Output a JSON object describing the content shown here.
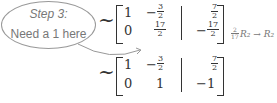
{
  "annotation": {
    "line1": "Step 3:",
    "line2": "Need a 1 here"
  },
  "tilde": "~",
  "matrix1": {
    "r1": {
      "c1": "1",
      "c2_sign": "−",
      "c2_num": "3",
      "c2_den": "2",
      "c3_num": "7",
      "c3_den": "2"
    },
    "r2": {
      "c1": "0",
      "c2_num": "17",
      "c2_den": "2",
      "c3_sign": "−",
      "c3_num": "17",
      "c3_den": "2"
    }
  },
  "operation": {
    "coef_num": "2",
    "coef_den": "17",
    "text": "R₂ → R₂"
  },
  "matrix2": {
    "r1": {
      "c1": "1",
      "c2_sign": "−",
      "c2_num": "3",
      "c2_den": "2",
      "c3_num": "7",
      "c3_den": "2"
    },
    "r2": {
      "c1": "0",
      "c2": "1",
      "c3": "−1"
    }
  }
}
